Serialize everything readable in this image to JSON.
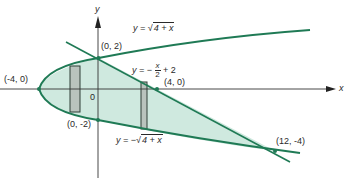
{
  "diagram": {
    "axes": {
      "x_label": "x",
      "y_label": "y",
      "origin_label": "0"
    },
    "curves": {
      "upper": {
        "label_prefix": "y = ",
        "label_radicand": "4 + x",
        "sqrt_symbol": "√"
      },
      "lower": {
        "label_prefix": "y = −",
        "label_radicand": "4 + x",
        "sqrt_symbol": "√"
      },
      "line": {
        "label_prefix": "y = −",
        "num": "x",
        "den": "2",
        "label_suffix": " + 2"
      }
    },
    "points": [
      {
        "label": "(-4, 0)"
      },
      {
        "label": "(0, 2)"
      },
      {
        "label": "(4, 0)"
      },
      {
        "label": "(0, -2)"
      },
      {
        "label": "(12, -4)"
      }
    ],
    "colors": {
      "curve": "#1f7a55",
      "fill": "#cfe9df",
      "rect": "#b9c3bd",
      "axis": "#333333"
    }
  }
}
